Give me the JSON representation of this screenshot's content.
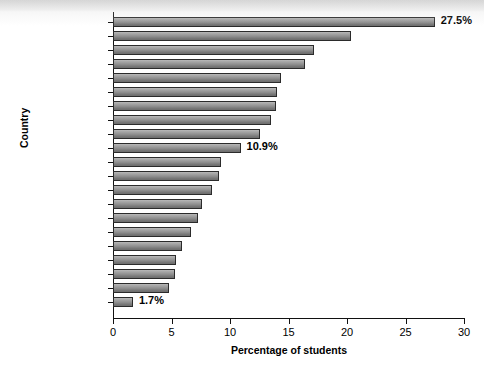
{
  "chart_data": {
    "type": "bar",
    "orientation": "horizontal",
    "title": "",
    "xlabel": "Percentage of students",
    "ylabel": "Country",
    "xlim": [
      0,
      30
    ],
    "xticks": [
      0,
      5,
      10,
      15,
      20,
      25,
      30
    ],
    "grid": false,
    "legend": null,
    "categories": [
      "Greece",
      "South Korea",
      "China",
      "Mexico",
      "United Kingdom",
      "United States",
      "Russia",
      "Hong Kong",
      "New Zealand",
      "Canada",
      "Lithuania",
      "Israel",
      "Australia",
      "Belgium",
      "Germany",
      "Brazil",
      "Switzerland",
      "Singapore",
      "Portugal",
      "Netherlands",
      "Sweden"
    ],
    "values": [
      27.5,
      20.3,
      17.2,
      16.4,
      14.4,
      14.0,
      13.9,
      13.5,
      12.6,
      10.9,
      9.2,
      9.1,
      8.5,
      7.6,
      7.3,
      6.7,
      5.9,
      5.4,
      5.3,
      4.8,
      1.7
    ],
    "annotations": [
      {
        "category": "Greece",
        "text": "27.5%"
      },
      {
        "category": "Canada",
        "text": "10.9%"
      },
      {
        "category": "Sweden",
        "text": "1.7%"
      }
    ],
    "highlighted_categories": [
      "Canada"
    ],
    "colors": {
      "bar_top": "#b9b9b9",
      "bar_bottom": "#6d6d6d",
      "bar_border": "#2b2b2b",
      "axis": "#111111",
      "text": "#000000",
      "background": "#ffffff"
    }
  }
}
